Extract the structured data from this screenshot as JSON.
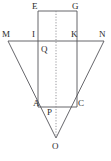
{
  "figure": {
    "name": "geometry-figure",
    "width": 111,
    "height": 161,
    "background_color": "#ffffff",
    "stroke_color": "#55555a",
    "dotted_color": "#8a8a90",
    "label_color": "#2b2b2b",
    "labels": [
      {
        "id": "E",
        "text": "E",
        "x": 32,
        "y": 2,
        "point_x": 38,
        "point_y": 11
      },
      {
        "id": "G",
        "text": "G",
        "x": 72,
        "y": 2,
        "point_x": 77,
        "point_y": 11
      },
      {
        "id": "M",
        "text": "M",
        "x": 2,
        "y": 30,
        "point_x": 8,
        "point_y": 41
      },
      {
        "id": "I",
        "text": "I",
        "x": 32,
        "y": 30,
        "point_x": 38,
        "point_y": 41
      },
      {
        "id": "K",
        "text": "K",
        "x": 71,
        "y": 30,
        "point_x": 77,
        "point_y": 41
      },
      {
        "id": "N",
        "text": "N",
        "x": 99,
        "y": 30,
        "point_x": 104,
        "point_y": 41
      },
      {
        "id": "Q",
        "text": "Q",
        "x": 41,
        "y": 45,
        "point_x": 56,
        "point_y": 41
      },
      {
        "id": "A",
        "text": "A",
        "x": 33,
        "y": 99,
        "point_x": 38,
        "point_y": 107
      },
      {
        "id": "P",
        "text": "P",
        "x": 47,
        "y": 108,
        "point_x": 56,
        "point_y": 107
      },
      {
        "id": "C",
        "text": "C",
        "x": 78,
        "y": 99,
        "point_x": 77,
        "point_y": 107
      },
      {
        "id": "O",
        "text": "O",
        "x": 52,
        "y": 142,
        "point_x": 56,
        "point_y": 138
      }
    ],
    "segments": [
      {
        "id": "triangle-side-MO",
        "from": "M",
        "to": "O",
        "x1": 8,
        "y1": 41,
        "x2": 56,
        "y2": 138,
        "style": "solid"
      },
      {
        "id": "triangle-side-NO",
        "from": "N",
        "to": "O",
        "x1": 104,
        "y1": 41,
        "x2": 56,
        "y2": 138,
        "style": "solid"
      },
      {
        "id": "triangle-base-MN",
        "from": "M",
        "to": "N",
        "x1": 8,
        "y1": 41,
        "x2": 104,
        "y2": 41,
        "style": "solid"
      },
      {
        "id": "rect-top-EG",
        "from": "E",
        "to": "G",
        "x1": 38,
        "y1": 11,
        "x2": 77,
        "y2": 11,
        "style": "solid"
      },
      {
        "id": "rect-left-EA",
        "from": "E",
        "to": "A",
        "x1": 38,
        "y1": 11,
        "x2": 38,
        "y2": 107,
        "style": "solid"
      },
      {
        "id": "rect-right-GC",
        "from": "G",
        "to": "C",
        "x1": 77,
        "y1": 11,
        "x2": 77,
        "y2": 107,
        "style": "solid"
      },
      {
        "id": "rect-bottom-AC",
        "from": "A",
        "to": "C",
        "x1": 38,
        "y1": 107,
        "x2": 77,
        "y2": 107,
        "style": "solid"
      },
      {
        "id": "axis-dotted-QPO",
        "from": "EG-midpoint",
        "to": "O",
        "x1": 56,
        "y1": 11,
        "x2": 56,
        "y2": 138,
        "style": "dotted"
      }
    ]
  }
}
